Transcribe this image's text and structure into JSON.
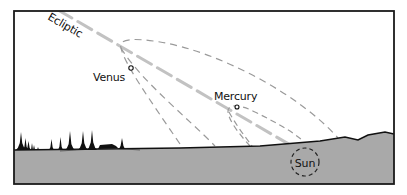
{
  "diagram": {
    "labels": {
      "ecliptic": "Ecliptic",
      "venus": "Venus",
      "mercury": "Mercury",
      "sun": "Sun"
    },
    "colors": {
      "frame": "#1a1a1a",
      "ground": "#a9a9a9",
      "ecliptic_line": "#c4c4c4",
      "orbit_dash": "#9a9a9a",
      "horizon": "#111111"
    }
  }
}
